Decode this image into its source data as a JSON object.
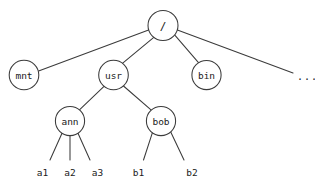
{
  "diagram": {
    "type": "tree",
    "stroke_color": "#3b3b3b",
    "text_color": "#1a1a1a",
    "background_color": "#ffffff",
    "nodes": [
      {
        "id": "root",
        "label": "/",
        "cx": 163,
        "cy": 25.5,
        "r": 15,
        "shape": "circle"
      },
      {
        "id": "mnt",
        "label": "mnt",
        "cx": 24,
        "cy": 75,
        "r": 14.8,
        "shape": "circle"
      },
      {
        "id": "usr",
        "label": "usr",
        "cx": 113.5,
        "cy": 75,
        "r": 14.8,
        "shape": "circle"
      },
      {
        "id": "bin",
        "label": "bin",
        "cx": 206.5,
        "cy": 75,
        "r": 14.6,
        "shape": "circle"
      },
      {
        "id": "ann",
        "label": "ann",
        "cx": 70,
        "cy": 121,
        "r": 14.6,
        "shape": "circle"
      },
      {
        "id": "bob",
        "label": "bob",
        "cx": 161,
        "cy": 121,
        "r": 14.6,
        "shape": "circle"
      }
    ],
    "leaves": [
      {
        "id": "a1",
        "label": "a1",
        "x": 42.5,
        "y": 176,
        "parent": "ann",
        "edge_end_x": 50,
        "edge_end_y": 160
      },
      {
        "id": "a2",
        "label": "a2",
        "x": 70,
        "y": 176,
        "parent": "ann",
        "edge_end_x": 70,
        "edge_end_y": 160
      },
      {
        "id": "a3",
        "label": "a3",
        "x": 97.5,
        "y": 176,
        "parent": "ann",
        "edge_end_x": 90,
        "edge_end_y": 160
      },
      {
        "id": "b1",
        "label": "b1",
        "x": 138.5,
        "y": 176,
        "parent": "bob",
        "edge_end_x": 143.5,
        "edge_end_y": 160
      },
      {
        "id": "b2",
        "label": "b2",
        "x": 192,
        "y": 176,
        "parent": "bob",
        "edge_end_x": 184,
        "edge_end_y": 160
      }
    ],
    "edges": [
      {
        "from": "root",
        "to": "mnt",
        "x1": 148.6,
        "y1": 29.9,
        "x2": 38.6,
        "y2": 71.1
      },
      {
        "from": "root",
        "to": "usr",
        "x1": 154.1,
        "y1": 37.2,
        "x2": 122.4,
        "y2": 63.3
      },
      {
        "from": "root",
        "to": "bin",
        "x1": 174.6,
        "y1": 34.9,
        "x2": 198.5,
        "y2": 62.6
      },
      {
        "from": "root",
        "to": "more",
        "x1": 177.4,
        "y1": 30.1,
        "x2": 293,
        "y2": 73
      }
    ],
    "ellipsis": {
      "label": "...",
      "x": 297,
      "y": 80
    },
    "root_slash": {
      "x1": 166,
      "y1": 19,
      "x2": 160.5,
      "y2": 32
    }
  }
}
